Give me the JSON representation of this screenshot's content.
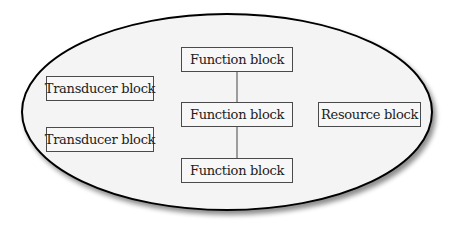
{
  "diagram": {
    "container": {
      "shape": "ellipse",
      "fill": "#f4f4f4",
      "stroke": "#000000"
    },
    "function_blocks": [
      {
        "label": "Function block"
      },
      {
        "label": "Function block"
      },
      {
        "label": "Function block"
      }
    ],
    "transducer_blocks": [
      {
        "label": "Transducer block"
      },
      {
        "label": "Transducer block"
      }
    ],
    "resource_block": {
      "label": "Resource block"
    },
    "connections": [
      {
        "from": "function_blocks.0",
        "to": "function_blocks.1"
      },
      {
        "from": "function_blocks.1",
        "to": "function_blocks.2"
      }
    ]
  }
}
